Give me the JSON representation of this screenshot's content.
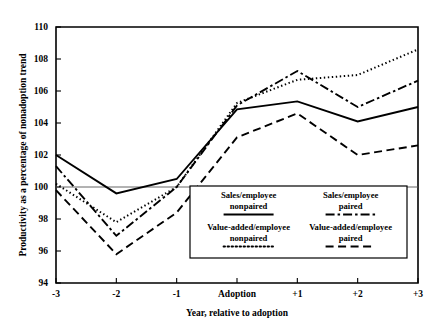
{
  "chart_data": {
    "type": "line",
    "title": "",
    "xlabel": "Year, relative to adoption",
    "ylabel": "Productivity as a percentage of nonadoption trend",
    "categories": [
      "-3",
      "-2",
      "-1",
      "Adoption",
      "+1",
      "+2",
      "+3"
    ],
    "x": [
      -3,
      -2,
      -1,
      0,
      1,
      2,
      3
    ],
    "ylim": [
      94,
      110
    ],
    "yticks": [
      94,
      96,
      98,
      100,
      102,
      104,
      106,
      108,
      110
    ],
    "ytick_labels": [
      "94",
      "96",
      "98",
      "100",
      "102",
      "104",
      "106",
      "108",
      "110"
    ],
    "xtick_labels": [
      "-3",
      "-2",
      "-1",
      "Adoption",
      "+1",
      "+2",
      "+3"
    ],
    "grid": false,
    "reference_line": 100,
    "legend_position": "inside-bottom-right",
    "series": [
      {
        "name": "Sales/employee nonpaired",
        "label_line1": "Sales/employee",
        "label_line2": "nonpaired",
        "style": "solid",
        "dasharray": "",
        "width": 1.9,
        "values": [
          102.0,
          99.6,
          100.5,
          104.85,
          105.35,
          104.1,
          105.0
        ]
      },
      {
        "name": "Sales/employee paired",
        "label_line1": "Sales/employee",
        "label_line2": "paired",
        "style": "dash-dot",
        "dasharray": "9,3,2.5,3",
        "width": 1.9,
        "values": [
          101.3,
          96.95,
          100.0,
          105.1,
          107.25,
          105.0,
          106.65
        ]
      },
      {
        "name": "Value-added/employee nonpaired",
        "label_line1": "Value-added/employee",
        "label_line2": "nonpaired",
        "style": "dotted",
        "dasharray": "1.4,2.6",
        "width": 2.0,
        "values": [
          100.2,
          97.8,
          100.0,
          105.25,
          106.7,
          107.0,
          108.6
        ]
      },
      {
        "name": "Value-added/employee paired",
        "label_line1": "Value-added/employee",
        "label_line2": "paired",
        "style": "dashed",
        "dasharray": "8,4.5",
        "width": 1.9,
        "values": [
          99.8,
          95.8,
          98.4,
          103.1,
          104.6,
          102.0,
          102.6
        ]
      }
    ],
    "colors": {
      "line": "#000000",
      "frame": "#000000",
      "background": "#ffffff",
      "reference_line": "#555555"
    }
  }
}
